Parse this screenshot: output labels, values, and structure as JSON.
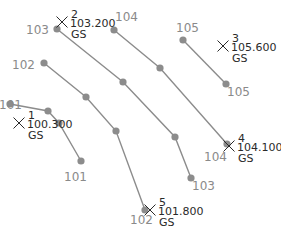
{
  "contours": [
    {
      "id": "101",
      "points": [
        [
          10,
          104
        ],
        [
          48,
          111
        ],
        [
          59,
          123
        ],
        [
          81,
          161
        ]
      ],
      "labels": [
        {
          "text": "101",
          "x": -1,
          "y": 109
        },
        {
          "text": "101",
          "x": 64,
          "y": 181
        }
      ]
    },
    {
      "id": "102",
      "points": [
        [
          44,
          63
        ],
        [
          86,
          97
        ],
        [
          116,
          131
        ],
        [
          145,
          210
        ]
      ],
      "labels": [
        {
          "text": "102",
          "x": 12,
          "y": 69
        },
        {
          "text": "102",
          "x": 130,
          "y": 224
        }
      ]
    },
    {
      "id": "103",
      "points": [
        [
          57,
          29
        ],
        [
          123,
          82
        ],
        [
          175,
          137
        ],
        [
          191,
          178
        ]
      ],
      "labels": [
        {
          "text": "103",
          "x": 26,
          "y": 34
        },
        {
          "text": "103",
          "x": 192,
          "y": 190
        }
      ]
    },
    {
      "id": "104",
      "points": [
        [
          114,
          30
        ],
        [
          160,
          68
        ],
        [
          227,
          144
        ]
      ],
      "labels": [
        {
          "text": "104",
          "x": 115,
          "y": 21
        },
        {
          "text": "104",
          "x": 204,
          "y": 161
        }
      ]
    },
    {
      "id": "105",
      "points": [
        [
          183,
          40
        ],
        [
          226,
          84
        ]
      ],
      "labels": [
        {
          "text": "105",
          "x": 176,
          "y": 32
        },
        {
          "text": "105",
          "x": 227,
          "y": 96
        }
      ]
    }
  ],
  "survey_points": [
    {
      "number": "1",
      "elevation": "100.300",
      "code": "GS",
      "x": 19,
      "y": 123
    },
    {
      "number": "2",
      "elevation": "103.200",
      "code": "GS",
      "x": 62,
      "y": 22
    },
    {
      "number": "3",
      "elevation": "105.600",
      "code": "GS",
      "x": 223,
      "y": 46
    },
    {
      "number": "4",
      "elevation": "104.100",
      "code": "GS",
      "x": 229,
      "y": 146
    },
    {
      "number": "5",
      "elevation": "101.800",
      "code": "GS",
      "x": 150,
      "y": 210
    }
  ],
  "colors": {
    "contour": "#8c8c8c",
    "point_text": "#2a2a2a",
    "background": "#ffffff"
  }
}
